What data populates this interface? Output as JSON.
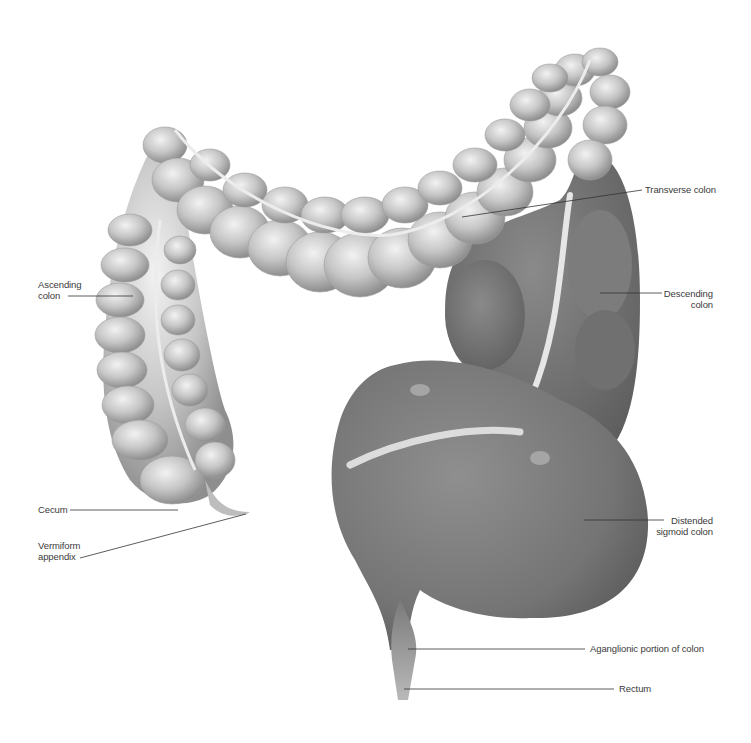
{
  "diagram": {
    "colors": {
      "background": "#ffffff",
      "normal_colon": "#c9c9c9",
      "distended_colon": "#7d7d7d",
      "leader_line": "#333333",
      "label_text": "#3a3a3a"
    },
    "labels": {
      "ascending_colon": {
        "line1": "Ascending",
        "line2": "colon"
      },
      "cecum": {
        "line1": "Cecum"
      },
      "vermiform_appendix": {
        "line1": "Vermiform",
        "line2": "appendix"
      },
      "transverse_colon": {
        "line1": "Transverse colon"
      },
      "descending_colon": {
        "line1": "Descending",
        "line2": "colon"
      },
      "distended_sigmoid_colon": {
        "line1": "Distended",
        "line2": "sigmoid colon"
      },
      "aganglionic_portion": {
        "line1": "Aganglionic portion of colon"
      },
      "rectum": {
        "line1": "Rectum"
      }
    }
  }
}
